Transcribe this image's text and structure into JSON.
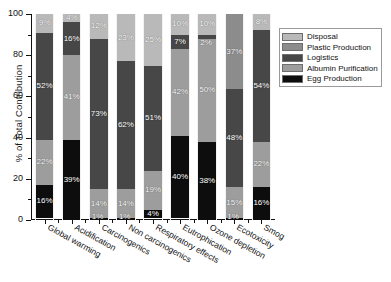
{
  "chart_data": {
    "type": "bar",
    "subtype": "stacked-100-percent",
    "title": "",
    "xlabel": "",
    "ylabel": "% of Total Contribution",
    "ylim": [
      0,
      100
    ],
    "ytick_labels": [
      "0",
      "20",
      "40",
      "60",
      "80",
      "100"
    ],
    "ytick_values": [
      0,
      20,
      40,
      60,
      80,
      100
    ],
    "grid": false,
    "legend_position": "right",
    "categories": [
      "Global warming",
      "Acidification",
      "Carcinogenics",
      "Non carcinogenics",
      "Respiratory effects",
      "Eutrophication",
      "Ozone depletion",
      "Ecotoxicity",
      "Smog"
    ],
    "series": [
      {
        "name": "Disposal",
        "color": "#b9b9b9",
        "values": [
          9,
          4,
          12,
          23,
          25,
          10,
          10,
          0,
          8
        ]
      },
      {
        "name": "Plastic Production",
        "color": "#8c8c8c",
        "values": [
          0,
          0,
          0,
          0,
          0,
          0,
          0,
          37,
          0
        ]
      },
      {
        "name": "Logistics",
        "color": "#474747",
        "values": [
          52,
          16,
          73,
          62,
          51,
          7,
          2,
          48,
          54
        ]
      },
      {
        "name": "Albumin Purification",
        "color": "#9d9d9d",
        "values": [
          22,
          41,
          14,
          14,
          19,
          42,
          50,
          15,
          22
        ]
      },
      {
        "name": "Egg Production",
        "color": "#0d0d0d",
        "values": [
          16,
          39,
          1,
          1,
          4,
          40,
          38,
          1,
          16
        ]
      }
    ],
    "bar_labels": [
      [
        "9%",
        "",
        "52%",
        "22%",
        "16%"
      ],
      [
        "4%",
        "",
        "16%",
        "41%",
        "39%"
      ],
      [
        "12%",
        "",
        "73%",
        "14%",
        "1%"
      ],
      [
        "23%",
        "",
        "62%",
        "14%",
        "1%"
      ],
      [
        "25%",
        "",
        "51%",
        "19%",
        "4%"
      ],
      [
        "10%",
        "",
        "7%",
        "42%",
        "40%"
      ],
      [
        "10%",
        "",
        "2%",
        "50%",
        "38%"
      ],
      [
        "",
        "37%",
        "48%",
        "15%",
        "1%"
      ],
      [
        "8%",
        "",
        "54%",
        "22%",
        "16%"
      ]
    ]
  },
  "legend": {
    "items": [
      {
        "label": "Disposal",
        "color": "#b9b9b9"
      },
      {
        "label": "Plastic Production",
        "color": "#8c8c8c"
      },
      {
        "label": "Logistics",
        "color": "#474747"
      },
      {
        "label": "Albumin Purification",
        "color": "#9d9d9d"
      },
      {
        "label": "Egg Production",
        "color": "#0d0d0d"
      }
    ]
  }
}
